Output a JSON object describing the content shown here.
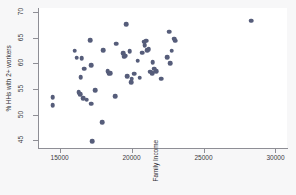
{
  "chart_data": {
    "type": "scatter",
    "title": "",
    "xlabel": "Family Income",
    "ylabel": "% HHs with 2+ workers",
    "xlim": [
      13500,
      30800
    ],
    "ylim": [
      43.5,
      70.8
    ],
    "xticks": [
      15000,
      20000,
      25000,
      30000
    ],
    "yticks": [
      45,
      50,
      55,
      60,
      65,
      70
    ],
    "grid": false,
    "legend": null,
    "marker_color": "#565d7a",
    "panel_background": "#ffffff",
    "figure_background": "#f7f7f8",
    "axis_color": "#8e8e95",
    "points": [
      {
        "x": 14520,
        "y": 53.4
      },
      {
        "x": 14530,
        "y": 51.9
      },
      {
        "x": 16050,
        "y": 62.5
      },
      {
        "x": 16180,
        "y": 61.1
      },
      {
        "x": 16330,
        "y": 54.4
      },
      {
        "x": 16420,
        "y": 54.0
      },
      {
        "x": 16480,
        "y": 57.3
      },
      {
        "x": 16550,
        "y": 61.0
      },
      {
        "x": 16620,
        "y": 53.2
      },
      {
        "x": 16700,
        "y": 59.0
      },
      {
        "x": 16880,
        "y": 52.9
      },
      {
        "x": 17120,
        "y": 64.5
      },
      {
        "x": 17180,
        "y": 59.7
      },
      {
        "x": 17200,
        "y": 52.1
      },
      {
        "x": 17260,
        "y": 44.8
      },
      {
        "x": 17480,
        "y": 54.8
      },
      {
        "x": 17980,
        "y": 48.5
      },
      {
        "x": 18020,
        "y": 62.6
      },
      {
        "x": 18330,
        "y": 58.5
      },
      {
        "x": 18400,
        "y": 58.0
      },
      {
        "x": 18520,
        "y": 58.1
      },
      {
        "x": 18880,
        "y": 53.6
      },
      {
        "x": 18950,
        "y": 63.8
      },
      {
        "x": 19420,
        "y": 62.0
      },
      {
        "x": 19480,
        "y": 61.3
      },
      {
        "x": 19550,
        "y": 61.5
      },
      {
        "x": 19620,
        "y": 67.6
      },
      {
        "x": 19700,
        "y": 57.5
      },
      {
        "x": 19880,
        "y": 62.4
      },
      {
        "x": 19960,
        "y": 56.3
      },
      {
        "x": 20020,
        "y": 57.0
      },
      {
        "x": 20180,
        "y": 58.0
      },
      {
        "x": 20420,
        "y": 60.5
      },
      {
        "x": 20560,
        "y": 57.2
      },
      {
        "x": 20720,
        "y": 62.1
      },
      {
        "x": 20880,
        "y": 64.2
      },
      {
        "x": 20920,
        "y": 63.6
      },
      {
        "x": 21020,
        "y": 64.4
      },
      {
        "x": 21100,
        "y": 62.6
      },
      {
        "x": 21180,
        "y": 62.8
      },
      {
        "x": 21280,
        "y": 58.4
      },
      {
        "x": 21420,
        "y": 58.1
      },
      {
        "x": 21480,
        "y": 60.2
      },
      {
        "x": 21580,
        "y": 59.0
      },
      {
        "x": 21700,
        "y": 58.5
      },
      {
        "x": 22050,
        "y": 57.0
      },
      {
        "x": 22480,
        "y": 61.2
      },
      {
        "x": 22620,
        "y": 66.2
      },
      {
        "x": 22700,
        "y": 60.0
      },
      {
        "x": 22780,
        "y": 62.5
      },
      {
        "x": 22980,
        "y": 64.8
      },
      {
        "x": 23020,
        "y": 64.4
      },
      {
        "x": 28320,
        "y": 68.3
      }
    ]
  }
}
